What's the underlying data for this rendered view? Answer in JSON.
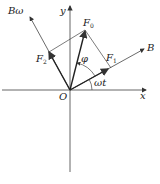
{
  "diagram": {
    "type": "vector-decomposition",
    "axes": {
      "x_label": "x",
      "y_label": "y",
      "origin_label": "O"
    },
    "rotating_axes": {
      "b_label": "B",
      "bomega_label": "Bω"
    },
    "vectors": {
      "f0": {
        "base": "F",
        "sub": "0"
      },
      "f1": {
        "base": "F",
        "sub": "1"
      },
      "f2": {
        "base": "F",
        "sub": "2"
      }
    },
    "angles": {
      "phi": "φ",
      "omega_t": "ωt"
    },
    "colors": {
      "stroke": "#333333",
      "background": "#ffffff"
    }
  }
}
